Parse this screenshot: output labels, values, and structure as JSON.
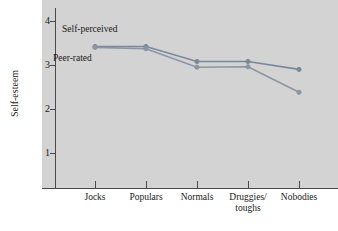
{
  "chart_data": {
    "type": "line",
    "title": "",
    "xlabel": "",
    "ylabel": "Self-esteem",
    "categories": [
      "Jocks",
      "Populars",
      "Normals",
      "Druggies/\ntoughs",
      "Nobodies"
    ],
    "ylim": [
      0,
      4.35
    ],
    "yticks": [
      1,
      2,
      3,
      4
    ],
    "ytick_labels": [
      "1",
      "2",
      "3",
      "4"
    ],
    "grid": false,
    "legend": "inline-annotations",
    "series": [
      {
        "name": "Self-perceived",
        "values": [
          3.42,
          3.42,
          3.08,
          3.08,
          2.9
        ],
        "color": "#78899b",
        "marker": "circle"
      },
      {
        "name": "Peer-rated",
        "values": [
          3.4,
          3.37,
          2.95,
          2.96,
          2.38
        ],
        "color": "#8a96a4",
        "marker": "circle"
      }
    ],
    "annotations": [
      {
        "text": "Self-perceived"
      },
      {
        "text": "Peer-rated"
      }
    ],
    "panel_color": "#d3d3d3",
    "axis_color": "#4a4a4a"
  },
  "axis": {
    "ylabel": "Self-esteem",
    "ytick_1": "1",
    "ytick_2": "2",
    "ytick_3": "3",
    "ytick_4": "4",
    "xtick_0": "Jocks",
    "xtick_1": "Populars",
    "xtick_2": "Normals",
    "xtick_3": "Druggies/\ntoughs",
    "xtick_4": "Nobodies"
  },
  "annotations": {
    "self_perceived": "Self-perceived",
    "peer_rated": "Peer-rated"
  }
}
